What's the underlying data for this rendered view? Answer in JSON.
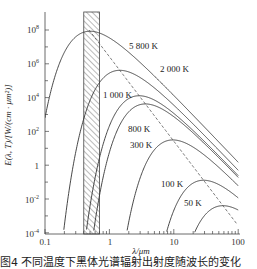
{
  "chart_data": {
    "type": "line",
    "title": "",
    "xlabel": "λ/μm",
    "ylabel": "E(λ, T)/[W/(cm·μm²)]",
    "xscale": "log",
    "yscale": "log",
    "xlim": [
      0.1,
      100
    ],
    "ylim": [
      0.0001,
      100000000
    ],
    "x_ticks": [
      "0.1",
      "1",
      "10",
      "100"
    ],
    "y_ticks": [
      {
        "value": 100000000,
        "label_base": "10",
        "label_exp": "8"
      },
      {
        "value": 1000000,
        "label_base": "10",
        "label_exp": "6"
      },
      {
        "value": 10000,
        "label_base": "10",
        "label_exp": "4"
      },
      {
        "value": 100,
        "label_base": "10",
        "label_exp": "2"
      },
      {
        "value": 1,
        "label_base": "1",
        "label_exp": ""
      },
      {
        "value": 0.01,
        "label_base": "10",
        "label_exp": "-2"
      },
      {
        "value": 0.0001,
        "label_base": "10",
        "label_exp": "-4"
      }
    ],
    "grid": false,
    "series": [
      {
        "name": "5 800 K",
        "temperature": 5800,
        "peak_lambda_um": 0.5,
        "peak_value": 83000000
      },
      {
        "name": "2 000 K",
        "temperature": 2000,
        "peak_lambda_um": 1.45,
        "peak_value": 410000
      },
      {
        "name": "1 000 K",
        "temperature": 1000,
        "peak_lambda_um": 2.9,
        "peak_value": 12800
      },
      {
        "name": "800 K",
        "temperature": 800,
        "peak_lambda_um": 3.6,
        "peak_value": 4200
      },
      {
        "name": "300 K",
        "temperature": 300,
        "peak_lambda_um": 9.7,
        "peak_value": 31
      },
      {
        "name": "100 K",
        "temperature": 100,
        "peak_lambda_um": 29,
        "peak_value": 0.13
      },
      {
        "name": "50 K",
        "temperature": 50,
        "peak_lambda_um": 58,
        "peak_value": 0.004
      }
    ],
    "annotations": [
      {
        "type": "shaded-band",
        "label": "visible region",
        "x_from": 0.4,
        "x_to": 0.7,
        "pattern": "hatched"
      },
      {
        "type": "dashed-line",
        "label": "Wien displacement locus (λmax·T = 2898 μm·K)"
      }
    ]
  },
  "labels": {
    "c5800": "5 800 K",
    "c2000": "2 000 K",
    "c1000": "1 000 K",
    "c800": "800 K",
    "c300": "300 K",
    "c100": "100 K",
    "c50": "50 K"
  },
  "axes": {
    "x_title": "λ/μm",
    "y_title": "E(λ, T)/[W/(cm · μm²)]",
    "x0": "0.1",
    "x1": "1",
    "x2": "10",
    "x3": "100",
    "y8": "10",
    "y8e": "8",
    "y6": "10",
    "y6e": "6",
    "y4": "10",
    "y4e": "4",
    "y2": "10",
    "y2e": "2",
    "y0": "1",
    "ym2": "10",
    "ym2e": "-2",
    "ym4": "10",
    "ym4e": "-4"
  },
  "caption": "图4   不同温度下黑体光谱辐射出射度随波长的变化",
  "colors": {
    "line": "#333333",
    "axis": "#444444",
    "hatch": "#555555"
  }
}
